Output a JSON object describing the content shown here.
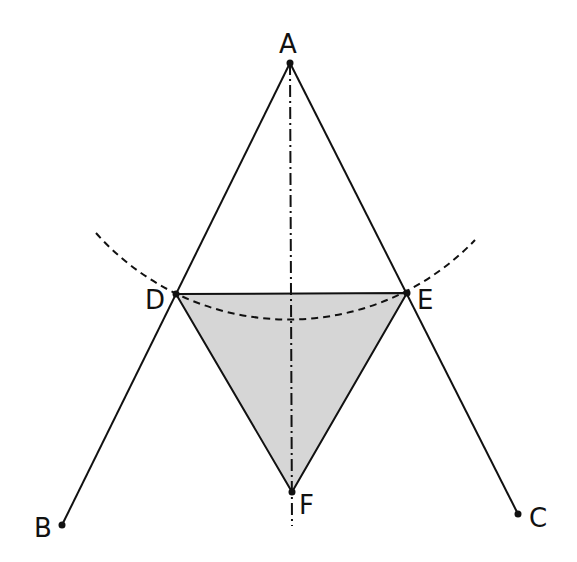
{
  "diagram": {
    "type": "geometric-construction",
    "colors": {
      "stroke": "#111111",
      "fill_triangle": "#d6d6d6",
      "background": "#ffffff"
    },
    "points": {
      "A": {
        "label": "A",
        "x": 290,
        "y": 63
      },
      "B": {
        "label": "B",
        "x": 62,
        "y": 525
      },
      "C": {
        "label": "C",
        "x": 518,
        "y": 514
      },
      "D": {
        "label": "D",
        "x": 176,
        "y": 294
      },
      "E": {
        "label": "E",
        "x": 407,
        "y": 293
      },
      "F": {
        "label": "F",
        "x": 292,
        "y": 492
      }
    },
    "segments": [
      {
        "from": "A",
        "to": "B",
        "style": "solid"
      },
      {
        "from": "A",
        "to": "C",
        "style": "solid"
      },
      {
        "from": "D",
        "to": "E",
        "style": "solid"
      },
      {
        "from": "D",
        "to": "F",
        "style": "solid"
      },
      {
        "from": "E",
        "to": "F",
        "style": "solid"
      }
    ],
    "axis": {
      "style": "dash-dot",
      "from": {
        "x": 290,
        "y": 63
      },
      "to": {
        "x": 292,
        "y": 526
      }
    },
    "arc": {
      "style": "dashed",
      "center": "A",
      "radius": 258,
      "from": {
        "x": 96,
        "y": 233
      },
      "to": {
        "x": 475,
        "y": 240
      }
    },
    "shaded_region": [
      "D",
      "E",
      "F"
    ]
  }
}
